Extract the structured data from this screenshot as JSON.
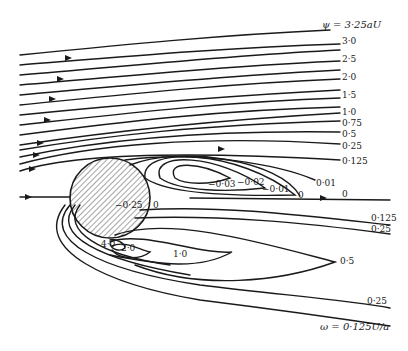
{
  "figure": {
    "streamline_labels": {
      "top": "ψ = 3·25aU",
      "s30": "3·0",
      "s25": "2·5",
      "s20": "2·0",
      "s15": "1·5",
      "s10": "1·0",
      "s075": "0·75",
      "s05": "0·5",
      "s025": "0·25",
      "s0125": "0·125",
      "s0": "0",
      "s001_outer": "0·01",
      "s0_inner": "0",
      "s001": "−0·01",
      "s002": "−0·02",
      "s003": "−0·03"
    },
    "vorticity_labels": {
      "inside_cylinder": "−0·25",
      "v0125": "0·125",
      "v025_upper": "0·25",
      "v05": "0·5",
      "v10": "1·0",
      "v20": "2·0",
      "v40": "4·0",
      "v025_lower": "0·25",
      "bottom": "ω = 0·125U/a",
      "v0_near": "0"
    }
  }
}
